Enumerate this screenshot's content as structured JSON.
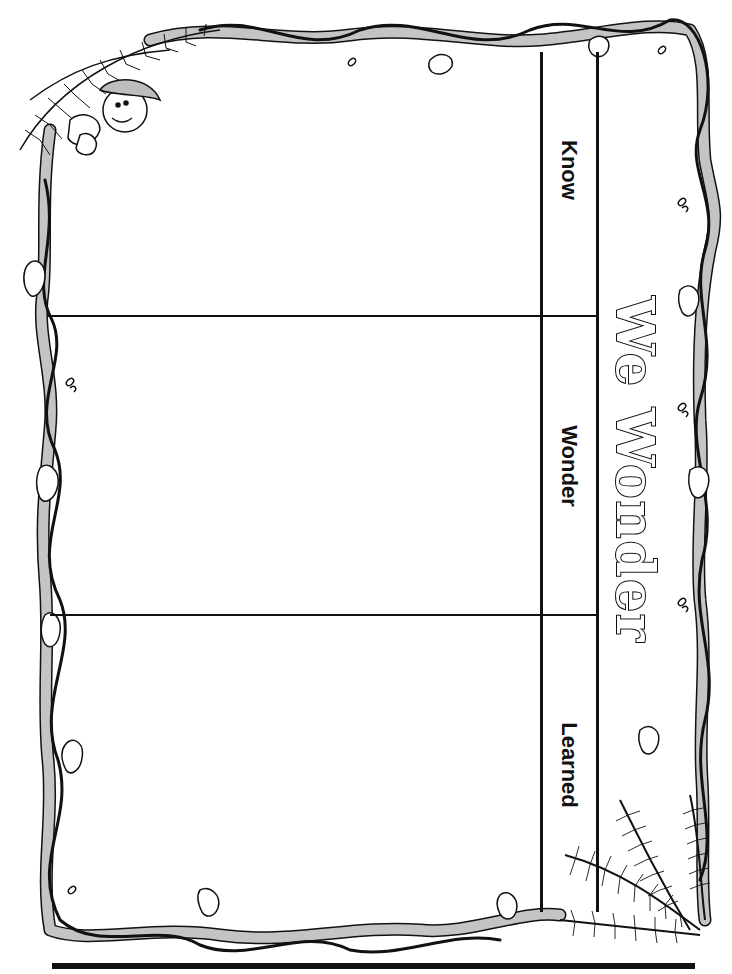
{
  "worksheet": {
    "title": "We Wonder",
    "columns": [
      {
        "label": "Know"
      },
      {
        "label": "Wonder"
      },
      {
        "label": "Learned"
      }
    ],
    "decorations": {
      "border": "vine-border",
      "top_left": "explorer-with-palm-fronds",
      "bottom_right": "palm-fronds"
    },
    "colors": {
      "line": "#111111",
      "vine": "#bdbdbd",
      "background": "#ffffff"
    }
  }
}
